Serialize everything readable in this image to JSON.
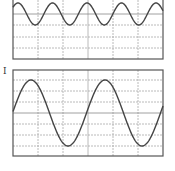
{
  "figure": {
    "panels": [
      {
        "id": "top",
        "label": "",
        "x": 13,
        "y": -2,
        "w": 150,
        "h": 61,
        "v_grid": [
          38,
          63,
          88,
          113,
          138
        ],
        "h_grid": [
          14,
          25,
          37,
          48
        ],
        "center_line": 14,
        "wave": {
          "center": 14,
          "amplitude": 11,
          "period": 34.5,
          "peak_x": 18
        }
      },
      {
        "id": "bottom",
        "label": "I",
        "x": 13,
        "y": 70,
        "w": 150,
        "h": 86,
        "v_grid": [
          38,
          63,
          88,
          113,
          138
        ],
        "h_grid": [
          80,
          91,
          102,
          113,
          124,
          135,
          146
        ],
        "center_line": 113,
        "wave": {
          "center": 113,
          "amplitude": 33,
          "period": 74,
          "peak_x": 31
        }
      }
    ],
    "colors": {
      "frame": "#555555",
      "grid": "#a8a8a8",
      "wave": "#444444"
    }
  }
}
